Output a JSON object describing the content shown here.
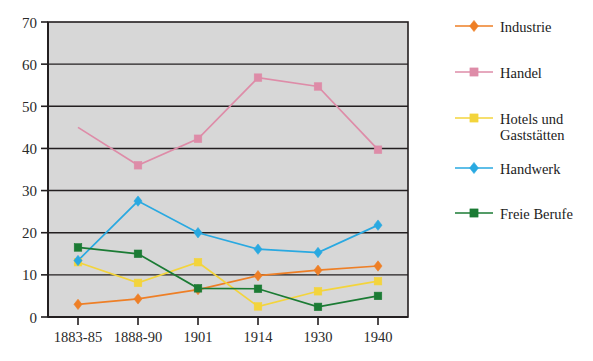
{
  "chart_data": {
    "type": "line",
    "title": "",
    "subtitle": "",
    "xlabel": "",
    "ylabel": "",
    "categories": [
      "1883-85",
      "1888-90",
      "1901",
      "1914",
      "1930",
      "1940"
    ],
    "ylim": [
      0,
      70
    ],
    "y_ticks": [
      0,
      10,
      20,
      30,
      40,
      50,
      60,
      70
    ],
    "grid": true,
    "legend_position": "right",
    "series": [
      {
        "name": "Industrie",
        "color": "#EE7F26",
        "marker": "diamond",
        "values": [
          3.0,
          4.3,
          6.5,
          9.8,
          11.1,
          12.1
        ]
      },
      {
        "name": "Handel",
        "color": "#DE8CA8",
        "marker": "square",
        "values": [
          45.0,
          36.0,
          42.3,
          56.8,
          54.7,
          39.7
        ]
      },
      {
        "name": "Hotels und Gaststätten",
        "color": "#F3D43C",
        "marker": "square",
        "values": [
          13.0,
          8.1,
          13.0,
          2.5,
          6.1,
          8.5
        ]
      },
      {
        "name": "Handwerk",
        "color": "#29A9E1",
        "marker": "diamond",
        "values": [
          13.4,
          27.5,
          20.0,
          16.1,
          15.3,
          21.8
        ]
      },
      {
        "name": "Freie Berufe",
        "color": "#1B7B34",
        "marker": "square",
        "values": [
          16.5,
          15.0,
          6.8,
          6.7,
          2.4,
          5.0
        ]
      }
    ]
  },
  "legend": {
    "items": [
      {
        "label": "Industrie",
        "line1": "Industrie",
        "line2": ""
      },
      {
        "label": "Handel",
        "line1": "Handel",
        "line2": ""
      },
      {
        "label": "Hotels und Gaststätten",
        "line1": "Hotels und",
        "line2": "Gaststätten"
      },
      {
        "label": "Handwerk",
        "line1": "Handwerk",
        "line2": ""
      },
      {
        "label": "Freie Berufe",
        "line1": "Freie Berufe",
        "line2": ""
      }
    ]
  },
  "colors": {
    "plot_background": "#d7d7d7",
    "axis": "#231f20",
    "page_background": "#ffffff"
  }
}
